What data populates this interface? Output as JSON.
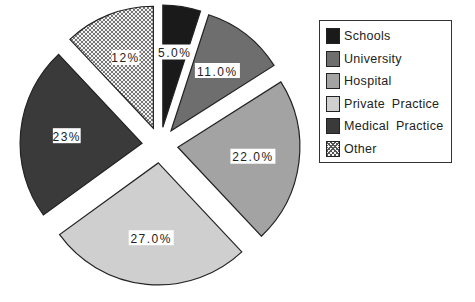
{
  "chart_data": {
    "type": "pie",
    "title": "",
    "start_angle_deg": 0,
    "direction": "clockwise",
    "exploded": true,
    "categories": [
      "Schools",
      "University",
      "Hospital",
      "Private Practice",
      "Medical Practice",
      "Other"
    ],
    "values": [
      5.0,
      11.0,
      22.0,
      27.0,
      23.0,
      12.0
    ],
    "value_labels": [
      "5.0%",
      "11.0%",
      "22.0%",
      "27.0%",
      "23%",
      "12%"
    ],
    "colors": [
      "#1a1a1a",
      "#6e6e6e",
      "#a3a3a3",
      "#cfcfcf",
      "#3a3a3a",
      "crosshatch"
    ],
    "legend_position": "right"
  },
  "legend": {
    "items": [
      {
        "label": "Schools",
        "color": "#1a1a1a"
      },
      {
        "label": "University",
        "color": "#6e6e6e"
      },
      {
        "label": "Hospital",
        "color": "#a3a3a3"
      },
      {
        "label": "Private Practice",
        "color": "#cfcfcf"
      },
      {
        "label": "Medical Practice",
        "color": "#3a3a3a"
      },
      {
        "label": "Other",
        "color": "crosshatch"
      }
    ]
  }
}
